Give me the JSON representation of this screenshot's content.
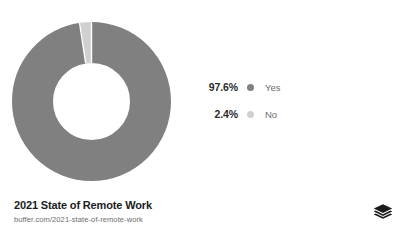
{
  "chart_data": {
    "type": "pie",
    "variant": "donut",
    "title": "2021 State of Remote Work",
    "categories": [
      "Yes",
      "No"
    ],
    "values": [
      97.6,
      2.4
    ],
    "value_labels": [
      "97.6%",
      "2.4%"
    ],
    "unit": "percent",
    "colors": [
      "#808080",
      "#d0d0d0"
    ],
    "legend_position": "right",
    "grid": false,
    "xlabel": "",
    "ylabel": "",
    "start_angle_deg": 0,
    "direction": "clockwise",
    "inner_radius_ratio": 0.35
  },
  "legend": {
    "items": [
      {
        "percent": "97.6%",
        "label": "Yes",
        "color": "#808080"
      },
      {
        "percent": "2.4%",
        "label": "No",
        "color": "#d0d0d0"
      }
    ]
  },
  "footer": {
    "title": "2021 State of Remote Work",
    "url": "buffer.com/2021-state-of-remote-work"
  },
  "brand": {
    "logo_name": "buffer-logo"
  },
  "colors": {
    "background": "#ffffff",
    "primary_slice": "#808080",
    "secondary_slice": "#d0d0d0",
    "title_text": "#1c1c1c",
    "muted_text": "#6d6d6d",
    "logo": "#1c1c1c"
  }
}
